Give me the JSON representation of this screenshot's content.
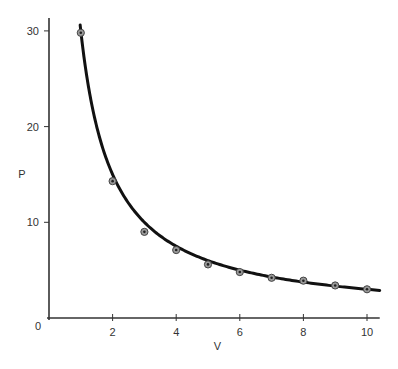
{
  "chart_data": {
    "type": "scatter",
    "title": "",
    "xlabel": "V",
    "ylabel": "P",
    "xlim": [
      0,
      10.4
    ],
    "ylim": [
      0,
      31
    ],
    "xticks": [
      2,
      4,
      6,
      8,
      10
    ],
    "yticks": [
      10,
      20,
      30
    ],
    "origin_label": "0",
    "grid": false,
    "legend": null,
    "series": [
      {
        "name": "measured",
        "type": "scatter",
        "x": [
          1,
          2,
          3,
          4,
          5,
          6,
          7,
          8,
          9,
          10
        ],
        "y": [
          29.8,
          14.3,
          9.0,
          7.1,
          5.6,
          4.8,
          4.2,
          3.9,
          3.4,
          3.0
        ]
      },
      {
        "name": "fit P = 30/V",
        "type": "line",
        "function": "30/x",
        "x_range": [
          0.98,
          10.4
        ]
      }
    ]
  }
}
